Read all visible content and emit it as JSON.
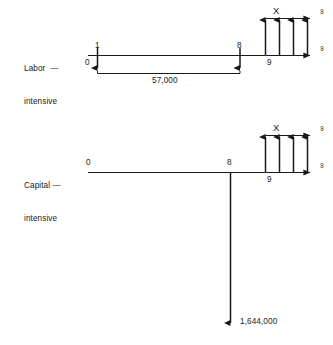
{
  "figure": {
    "type": "cash-flow-timeline-diagram",
    "line_color": "#1a1a1a",
    "background": "#ffffff"
  },
  "scenarios": [
    {
      "id": "labor-intensive",
      "label_line1": "Labor  —",
      "label_line2": "intensive",
      "timeline": {
        "start_period": "0",
        "end_period": "9",
        "period_marks": [
          "0",
          "1",
          "8",
          "9"
        ]
      },
      "outflows": [
        {
          "period": "1",
          "direction": "down"
        },
        {
          "period": "8",
          "direction": "down"
        }
      ],
      "bracket_amount": "57,000",
      "inflow_series": {
        "label": "X",
        "count": 4,
        "direction": "up",
        "start_period": "9",
        "end_marker": "∞",
        "top_marker": "∞"
      }
    },
    {
      "id": "capital-intensive",
      "label_line1": "Capital —",
      "label_line2": "intensive",
      "timeline": {
        "start_period": "0",
        "end_period": "9",
        "period_marks": [
          "0",
          "8",
          "9"
        ]
      },
      "outflows": [
        {
          "period": "8",
          "direction": "down",
          "amount": "1,644,000"
        }
      ],
      "bracket_amount": "1,644,000",
      "inflow_series": {
        "label": "X",
        "count": 4,
        "direction": "up",
        "start_period": "9",
        "end_marker": "∞",
        "top_marker": "∞"
      }
    }
  ],
  "labels": {
    "labor_scenario_line1": "Labor  —",
    "labor_scenario_line2": "intensive",
    "capital_scenario_line1": "Capital —",
    "capital_scenario_line2": "intensive",
    "labor_zero": "0",
    "labor_one": "1",
    "labor_eight": "8",
    "labor_nine": "9",
    "labor_amount": "57,000",
    "labor_x": "X",
    "labor_inf_top": "∞",
    "labor_inf_bottom": "∞",
    "capital_zero": "0",
    "capital_eight": "8",
    "capital_nine": "9",
    "capital_amount": "1,644,000",
    "capital_x": "X",
    "capital_inf_top": "∞",
    "capital_inf_bottom": "∞"
  },
  "footer": {
    "caption_fragment": ""
  }
}
